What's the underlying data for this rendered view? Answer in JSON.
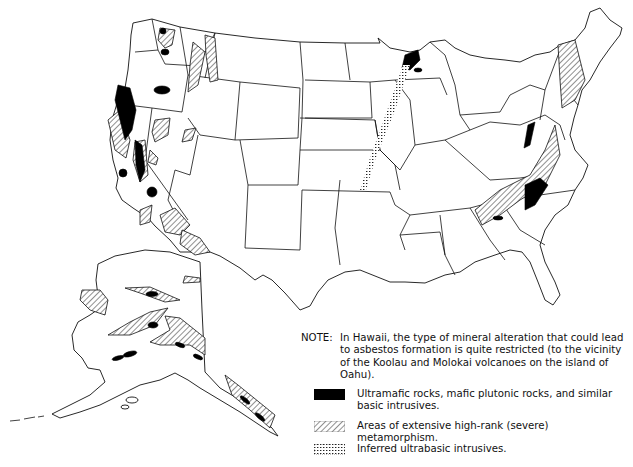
{
  "map": {
    "subject": "Distribution of rock types associated with asbestos formation in the United States",
    "regions_shown": [
      "Conterminous United States",
      "Alaska"
    ]
  },
  "note": {
    "label": "NOTE:",
    "text": "In Hawaii, the type of mineral alteration that could lead to asbestos formation is quite restricted (to the vicinity of the Koolau and Molokai volcanoes on the island of Oahu)."
  },
  "legend": {
    "items": [
      {
        "symbol": "solid-black",
        "label": "Ultramafic rocks, mafic plutonic rocks, and similar basic intrusives."
      },
      {
        "symbol": "diagonal-hatch",
        "label": "Areas of extensive high-rank (severe) metamorphism."
      },
      {
        "symbol": "stipple",
        "label": "Inferred ultrabasic intrusives."
      }
    ]
  },
  "colors": {
    "background": "#ffffff",
    "ink": "#111111"
  }
}
